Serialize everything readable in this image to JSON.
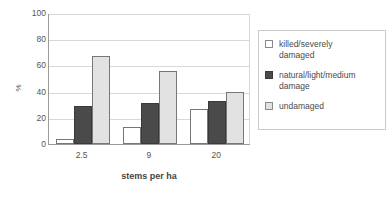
{
  "chart_data": {
    "type": "bar",
    "title": "",
    "xlabel": "stems per ha",
    "ylabel": "%",
    "categories": [
      "2.5",
      "9",
      "20"
    ],
    "series": [
      {
        "name": "killed/severely damaged",
        "values": [
          4,
          13,
          27
        ],
        "color": "#ffffff"
      },
      {
        "name": "natural/light/medium damage",
        "values": [
          29,
          31,
          33
        ],
        "color": "#4a4a4a"
      },
      {
        "name": "undamaged",
        "values": [
          67,
          56,
          40
        ],
        "color": "#e2e2e2"
      }
    ],
    "ylim": [
      0,
      100
    ],
    "yticks": [
      100,
      80,
      60,
      40,
      20,
      0
    ],
    "grid": true,
    "legend_position": "right",
    "legend_labels": [
      "killed/severely\ndamaged",
      "natural/light/medium\ndamage",
      "undamaged"
    ]
  }
}
